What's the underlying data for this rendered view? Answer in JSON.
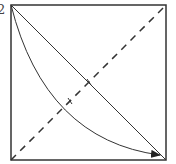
{
  "diagram": {
    "corner_label": "2",
    "stroke_color": "#333333",
    "square": {
      "x": 11,
      "y": 5,
      "size": 155
    },
    "elements": [
      {
        "type": "solid-diagonal",
        "from": "top-left",
        "to": "bottom-right"
      },
      {
        "type": "dashed-diagonal",
        "from": "bottom-left",
        "to": "top-right"
      },
      {
        "type": "curved-arrow",
        "from": "top-left",
        "to": "bottom-right"
      }
    ]
  }
}
